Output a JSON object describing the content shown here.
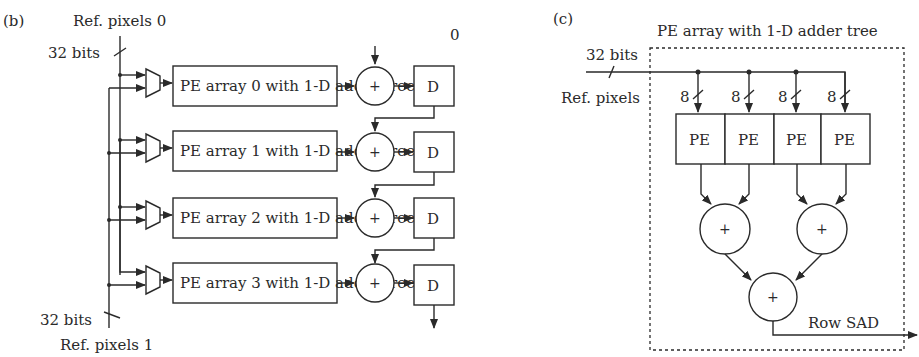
{
  "panel_b": {
    "label": "(b)",
    "ref_pixels_0": "Ref. pixels 0",
    "ref_pixels_1": "Ref. pixels 1",
    "bits_top": "32 bits",
    "bits_bottom": "32 bits",
    "adder_init": "0",
    "plus": "+",
    "delay": "D",
    "rows": [
      {
        "label": "PE array 0 with 1-D adder tree"
      },
      {
        "label": "PE array 1 with 1-D adder tree"
      },
      {
        "label": "PE array 2 with 1-D adder tree"
      },
      {
        "label": "PE array 3 with 1-D adder tree"
      }
    ]
  },
  "panel_c": {
    "label": "(c)",
    "title": "PE array with 1-D adder tree",
    "bits": "32 bits",
    "ref_pixels": "Ref. pixels",
    "bus_width": "8",
    "pe_label": "PE",
    "plus": "+",
    "output": "Row SAD",
    "pe_count": 4
  }
}
